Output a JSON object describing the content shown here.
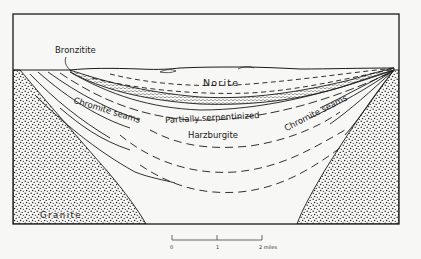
{
  "figure": {
    "type": "geologic-cross-section",
    "colors": {
      "background": "#f7f7f5",
      "line": "#1a1a1a",
      "granite_dots": "#222222"
    },
    "labels": {
      "bronzitite": "Bronzitite",
      "norite": "Norite",
      "chromite_seams_left": "Chromite seams",
      "chromite_seams_right": "Chromite seams",
      "serpentinized_line1": "Partially serpentinized",
      "serpentinized_line2": "Harzburgite",
      "granite": "Granite"
    },
    "scale_bar": {
      "ticks": [
        "0",
        "1",
        "2 miles"
      ],
      "unit": "miles"
    }
  }
}
